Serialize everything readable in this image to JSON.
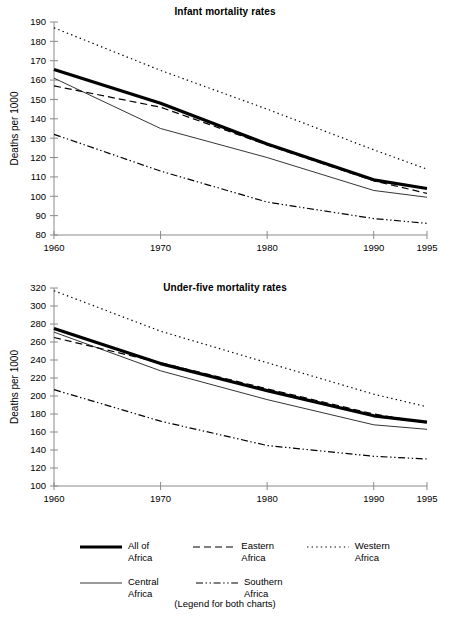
{
  "chart_data": [
    {
      "type": "line",
      "title": "Infant mortality rates",
      "xlabel": "",
      "ylabel": "Deaths per 1000",
      "x": [
        1960,
        1970,
        1980,
        1990,
        1995
      ],
      "xticks": [
        "1960",
        "1970",
        "1980",
        "1990",
        "1995"
      ],
      "xlim": [
        1960,
        1995
      ],
      "ylim": [
        80,
        190
      ],
      "yticks": [
        "80",
        "90",
        "100",
        "110",
        "120",
        "130",
        "140",
        "150",
        "160",
        "170",
        "180",
        "190"
      ],
      "ytick_step": 10,
      "grid": false,
      "legend_position": "below-both-charts",
      "series": [
        {
          "name": "All of Africa",
          "style": "thick-solid",
          "values": [
            165.5,
            148,
            127,
            108.5,
            104
          ]
        },
        {
          "name": "Eastern Africa",
          "style": "dashed",
          "values": [
            157,
            146,
            126.5,
            108,
            101.5
          ]
        },
        {
          "name": "Western Africa",
          "style": "dotted",
          "values": [
            187,
            165,
            145,
            124,
            114
          ]
        },
        {
          "name": "Central Africa",
          "style": "thin-solid",
          "values": [
            161,
            135,
            120,
            103,
            99.5
          ]
        },
        {
          "name": "Southern Africa",
          "style": "dash-dot",
          "values": [
            132,
            113,
            97,
            88.5,
            86
          ]
        }
      ]
    },
    {
      "type": "line",
      "title": "Under-five mortality rates",
      "xlabel": "",
      "ylabel": "Deaths per 1000",
      "x": [
        1960,
        1970,
        1980,
        1990,
        1995
      ],
      "xticks": [
        "1960",
        "1970",
        "1980",
        "1990",
        "1995"
      ],
      "xlim": [
        1960,
        1995
      ],
      "ylim": [
        100,
        320
      ],
      "yticks": [
        "100",
        "120",
        "140",
        "160",
        "180",
        "200",
        "220",
        "240",
        "260",
        "280",
        "300",
        "320"
      ],
      "ytick_step": 20,
      "grid": false,
      "legend_position": "below-both-charts",
      "series": [
        {
          "name": "All of Africa",
          "style": "thick-solid",
          "values": [
            275,
            236,
            206,
            178,
            171
          ]
        },
        {
          "name": "Eastern Africa",
          "style": "dashed",
          "values": [
            265,
            237,
            208,
            180,
            170
          ]
        },
        {
          "name": "Western Africa",
          "style": "dotted",
          "values": [
            317,
            272,
            237,
            202,
            188
          ]
        },
        {
          "name": "Central Africa",
          "style": "thin-solid",
          "values": [
            271,
            228,
            196,
            168,
            163
          ]
        },
        {
          "name": "Southern Africa",
          "style": "dash-dot",
          "values": [
            207,
            172,
            145,
            133,
            130
          ]
        }
      ]
    }
  ],
  "legend": {
    "note": "(Legend for both charts)",
    "rows": [
      [
        {
          "label": "All of\nAfrica",
          "style": "thick-solid"
        },
        {
          "label": "Eastern\nAfrica",
          "style": "dashed"
        },
        {
          "label": "Western\nAfrica",
          "style": "dotted"
        }
      ],
      [
        {
          "label": "Central\nAfrica",
          "style": "thin-solid"
        },
        {
          "label": "Southern\nAfrica",
          "style": "dash-dot"
        }
      ]
    ]
  }
}
